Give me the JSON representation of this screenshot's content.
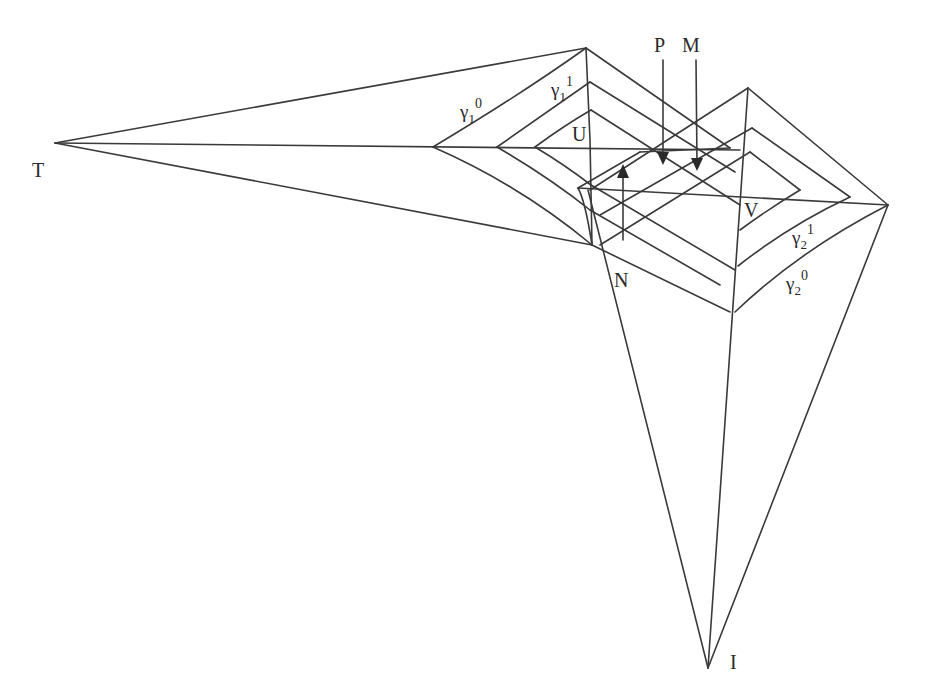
{
  "diagram": {
    "points": {
      "T": "T",
      "I": "I",
      "U": "U",
      "V": "V",
      "P": "P",
      "M": "M",
      "N": "N"
    },
    "curves": {
      "gamma1_0": {
        "base": "γ",
        "sub": "1",
        "sup": "0"
      },
      "gamma1_1": {
        "base": "γ",
        "sub": "1",
        "sup": "1"
      },
      "gamma2_1": {
        "base": "γ",
        "sub": "2",
        "sup": "1"
      },
      "gamma2_0": {
        "base": "γ",
        "sub": "2",
        "sup": "0"
      }
    },
    "colors": {
      "line": "#3a3a3a",
      "text": "#2a2a2a",
      "background": "#ffffff"
    }
  }
}
